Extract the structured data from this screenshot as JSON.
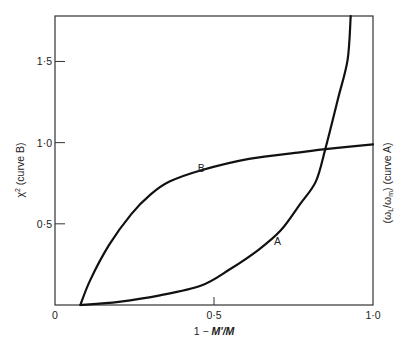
{
  "chart_data": {
    "type": "line",
    "title": "",
    "xlabel": "1-M'/M",
    "ylabel_left": "χ² (curve B)",
    "ylabel_right": "(ωL/ωm) (curve A)",
    "xlim": [
      0,
      1.0
    ],
    "ylim": [
      0,
      1.78
    ],
    "grid": false,
    "legend": "inline curve labels",
    "x_ticks": [
      {
        "value": 0,
        "label": "0"
      },
      {
        "value": 0.5,
        "label": "0·5"
      },
      {
        "value": 1.0,
        "label": "1·0"
      }
    ],
    "y_ticks": [
      {
        "value": 0.5,
        "label": "0·5"
      },
      {
        "value": 1.0,
        "label": "1·0"
      },
      {
        "value": 1.5,
        "label": "1·5"
      }
    ],
    "series": [
      {
        "name": "B",
        "description": "χ² (curve B)",
        "x": [
          0.08,
          0.11,
          0.17,
          0.24,
          0.3,
          0.36,
          0.46,
          0.61,
          0.77,
          0.85,
          1.0
        ],
        "y": [
          0.0,
          0.15,
          0.37,
          0.56,
          0.68,
          0.76,
          0.83,
          0.9,
          0.94,
          0.96,
          0.99
        ],
        "label_pos": [
          0.46,
          0.82
        ]
      },
      {
        "name": "A",
        "description": "ωL/ωm (curve A)",
        "x": [
          0.08,
          0.2,
          0.33,
          0.46,
          0.55,
          0.64,
          0.71,
          0.77,
          0.82,
          0.85,
          0.89,
          0.92,
          0.93
        ],
        "y": [
          0.0,
          0.02,
          0.06,
          0.12,
          0.22,
          0.34,
          0.46,
          0.62,
          0.76,
          0.96,
          1.27,
          1.51,
          1.78
        ],
        "label_pos": [
          0.7,
          0.37
        ]
      }
    ]
  },
  "labels": {
    "x_axis": "1-M'/M",
    "x_axis_prefix": "1 − ",
    "x_axis_var": "M'/M",
    "y_left": "χ² (curve B)",
    "y_left_chi": "χ",
    "y_left_sup": "2",
    "y_left_rest": " (curve B)",
    "y_right": "(ωL/ωm)  (curve A)",
    "y_right_open": "(ω",
    "y_right_sub1": "L",
    "y_right_mid": "/ω",
    "y_right_sub2": "m",
    "y_right_close": ")   (curve A)",
    "curve_a": "A",
    "curve_b": "B",
    "origin": "0"
  }
}
